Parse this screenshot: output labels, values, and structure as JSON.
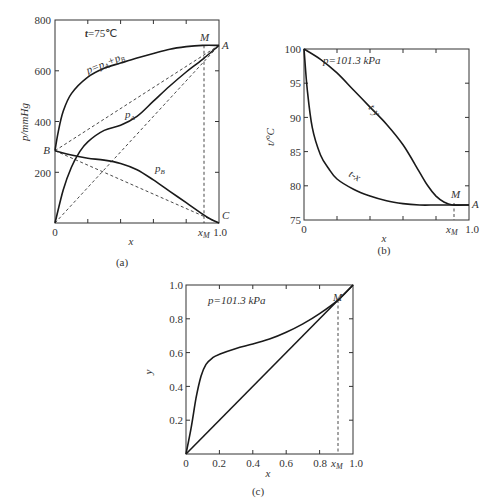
{
  "chart_data": [
    {
      "id": "a",
      "type": "line",
      "caption": "(a)",
      "annotation": "t=75℃",
      "xlabel": "x",
      "ylabel": "p/mmHg",
      "xlim": [
        0,
        1
      ],
      "ylim": [
        0,
        800
      ],
      "x_tick_labels": [
        "0",
        "x_M",
        "1.0"
      ],
      "y_tick_labels": [
        "200",
        "400",
        "600",
        "800"
      ],
      "point_labels": [
        "M",
        "A",
        "B",
        "C"
      ],
      "series": [
        {
          "name": "p=pA+pB",
          "x": [
            0,
            0.02,
            0.05,
            0.1,
            0.2,
            0.3,
            0.4,
            0.5,
            0.6,
            0.7,
            0.8,
            0.9,
            1.0
          ],
          "values": [
            285,
            360,
            440,
            510,
            575,
            610,
            630,
            650,
            668,
            685,
            695,
            700,
            700
          ]
        },
        {
          "name": "pA",
          "x": [
            0,
            0.05,
            0.1,
            0.15,
            0.2,
            0.3,
            0.4,
            0.5,
            0.6,
            0.7,
            0.8,
            0.9,
            1.0
          ],
          "values": [
            0,
            130,
            220,
            280,
            320,
            365,
            385,
            420,
            480,
            540,
            595,
            645,
            700
          ]
        },
        {
          "name": "pB",
          "x": [
            0,
            0.1,
            0.2,
            0.3,
            0.4,
            0.5,
            0.6,
            0.7,
            0.8,
            0.9,
            0.95,
            1.0
          ],
          "values": [
            285,
            268,
            255,
            248,
            235,
            210,
            170,
            125,
            80,
            35,
            15,
            0
          ]
        },
        {
          "name": "ideal p (dashed B-A)",
          "x": [
            0,
            1
          ],
          "values": [
            285,
            700
          ],
          "style": "dashed"
        },
        {
          "name": "ideal pA (dashed 0-A)",
          "x": [
            0,
            1
          ],
          "values": [
            0,
            700
          ],
          "style": "dashed"
        },
        {
          "name": "ideal pB (dashed B-C)",
          "x": [
            0,
            1
          ],
          "values": [
            285,
            0
          ],
          "style": "dashed"
        }
      ],
      "x_M": 0.91
    },
    {
      "id": "b",
      "type": "line",
      "caption": "(b)",
      "annotation": "p=101.3 kPa",
      "xlabel": "x",
      "ylabel": "t/°C",
      "xlim": [
        0,
        1
      ],
      "ylim": [
        75,
        100
      ],
      "x_tick_labels": [
        "0",
        "x_M",
        "1.0"
      ],
      "y_tick_labels": [
        "75",
        "80",
        "85",
        "90",
        "95",
        "100"
      ],
      "point_labels": [
        "M",
        "A"
      ],
      "series": [
        {
          "name": "t-y",
          "x": [
            0,
            0.1,
            0.2,
            0.3,
            0.4,
            0.5,
            0.6,
            0.7,
            0.75,
            0.8,
            0.85,
            0.9,
            1.0
          ],
          "values": [
            100,
            98.5,
            96.5,
            94,
            91.5,
            89,
            86,
            82,
            80,
            78.5,
            77.6,
            77.2,
            77.2
          ]
        },
        {
          "name": "t-x",
          "x": [
            0,
            0.02,
            0.05,
            0.1,
            0.15,
            0.2,
            0.3,
            0.4,
            0.5,
            0.6,
            0.7,
            0.8,
            0.9,
            1.0
          ],
          "values": [
            100,
            94,
            88.5,
            84.5,
            82.5,
            81,
            79.5,
            78.5,
            77.8,
            77.4,
            77.2,
            77.2,
            77.2,
            77.2
          ]
        }
      ],
      "x_M": 0.91
    },
    {
      "id": "c",
      "type": "line",
      "caption": "(c)",
      "annotation": "p=101.3 kPa",
      "xlabel": "x",
      "ylabel": "y",
      "xlim": [
        0,
        1
      ],
      "ylim": [
        0,
        1
      ],
      "x_tick_labels": [
        "0",
        "0.2",
        "0.4",
        "0.6",
        "0.8",
        "x_M",
        "1.0"
      ],
      "y_tick_labels": [
        "0.2",
        "0.4",
        "0.6",
        "0.8",
        "1.0"
      ],
      "point_labels": [
        "M"
      ],
      "series": [
        {
          "name": "y-x equilibrium",
          "x": [
            0,
            0.03,
            0.06,
            0.09,
            0.12,
            0.16,
            0.2,
            0.3,
            0.4,
            0.5,
            0.6,
            0.7,
            0.8,
            0.91,
            1.0
          ],
          "values": [
            0,
            0.15,
            0.33,
            0.46,
            0.53,
            0.57,
            0.59,
            0.625,
            0.65,
            0.68,
            0.72,
            0.77,
            0.83,
            0.91,
            1.0
          ]
        },
        {
          "name": "diagonal y=x",
          "x": [
            0,
            1
          ],
          "values": [
            0,
            1
          ]
        }
      ],
      "x_M": 0.91
    }
  ],
  "labels": {
    "a": {
      "caption": "(a)",
      "t": "t=75℃",
      "ylabel": "p/mmHg",
      "xlabel": "x",
      "sum": "p=p",
      "sumA": "A",
      "plus": "+p",
      "sumB": "B",
      "pA": "p",
      "pAsub": "A",
      "pB": "p",
      "pBsub": "B",
      "M": "M",
      "A": "A",
      "B": "B",
      "C": "C",
      "x0": "0",
      "xM": "x",
      "xMsub": "M",
      "x1": "1.0",
      "y800": "800",
      "y600": "600",
      "y400": "400",
      "y200": "200"
    },
    "b": {
      "caption": "(b)",
      "p": "p=101.3 kPa",
      "ylabel": "t/°C",
      "xlabel": "x",
      "ty": "t-y",
      "tx": "t-x",
      "M": "M",
      "A": "A",
      "x0": "0",
      "xM": "x",
      "xMsub": "M",
      "x1": "1.0",
      "y100": "100",
      "y95": "95",
      "y90": "90",
      "y85": "85",
      "y80": "80",
      "y75": "75"
    },
    "c": {
      "caption": "(c)",
      "p": "p=101.3 kPa",
      "ylabel": "y",
      "xlabel": "x",
      "M": "M",
      "x0": "0",
      "x02": "0.2",
      "x04": "0.4",
      "x06": "0.6",
      "x08": "0.8",
      "xM": "x",
      "xMsub": "M",
      "x1": "1.0",
      "y02": "0.2",
      "y04": "0.4",
      "y06": "0.6",
      "y08": "0.8",
      "y10": "1.0"
    }
  }
}
